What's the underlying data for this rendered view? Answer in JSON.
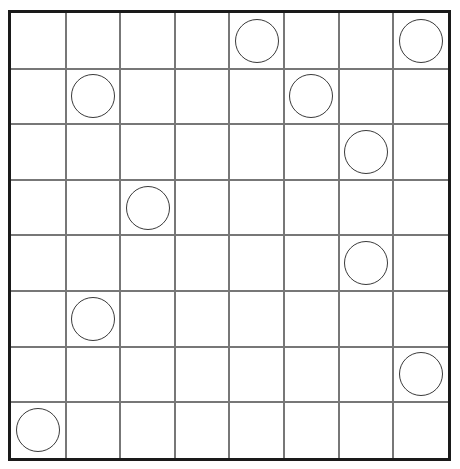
{
  "board": {
    "name": "circles-grid-puzzle",
    "type": "grid",
    "rows": 8,
    "columns": 8,
    "origin_x": 11,
    "origin_y": 13,
    "cell_width": 54.6,
    "cell_height": 55.6,
    "border_color": "#1a1a1a",
    "line_color": "#777777",
    "background_color": "#ffffff",
    "border_width": 3,
    "line_width": 2
  },
  "piece_style": {
    "shape": "circle",
    "fill": "none",
    "stroke_color": "#3a3a3a",
    "stroke_width": 1.6,
    "diameter": 44
  },
  "pieces": [
    {
      "label": "circle-r1c5",
      "row": 1,
      "col": 5
    },
    {
      "label": "circle-r1c8",
      "row": 1,
      "col": 8
    },
    {
      "label": "circle-r2c2",
      "row": 2,
      "col": 2
    },
    {
      "label": "circle-r2c6",
      "row": 2,
      "col": 6
    },
    {
      "label": "circle-r3c7",
      "row": 3,
      "col": 7
    },
    {
      "label": "circle-r4c3",
      "row": 4,
      "col": 3
    },
    {
      "label": "circle-r5c7",
      "row": 5,
      "col": 7
    },
    {
      "label": "circle-r6c2",
      "row": 6,
      "col": 2
    },
    {
      "label": "circle-r7c8",
      "row": 7,
      "col": 8
    },
    {
      "label": "circle-r8c1",
      "row": 8,
      "col": 1
    }
  ]
}
